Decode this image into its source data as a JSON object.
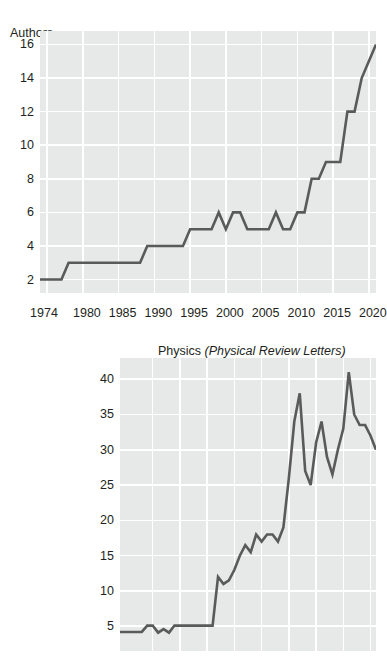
{
  "figure": {
    "axis_title": "Authors"
  },
  "chart_data": [
    {
      "type": "line",
      "id": "biology",
      "title": "Biology (Cell)",
      "title_plain": "Biology",
      "title_italic": "(Cell)",
      "xlabel": "",
      "ylabel": "Authors",
      "xlim": [
        1974,
        2021
      ],
      "ylim": [
        1.2,
        16.8
      ],
      "grid": true,
      "legend": "none",
      "line_color": "#5a5a5a",
      "plot_background": "#e7e8e8",
      "gridline_color": "#ffffff",
      "xticks": [
        1974,
        1980,
        1985,
        1990,
        1995,
        2000,
        2005,
        2010,
        2015,
        2020
      ],
      "xtick_labels": [
        "1974",
        "1980",
        "1985",
        "1990",
        "1995",
        "2000",
        "2005",
        "2010",
        "2015",
        "2020"
      ],
      "yticks": [
        2,
        4,
        6,
        8,
        10,
        12,
        14,
        16
      ],
      "ytick_labels": [
        "2",
        "4",
        "6",
        "8",
        "10",
        "12",
        "14",
        "16"
      ],
      "x": [
        1974,
        1975,
        1976,
        1977,
        1978,
        1979,
        1980,
        1981,
        1982,
        1983,
        1984,
        1985,
        1986,
        1987,
        1988,
        1989,
        1990,
        1991,
        1992,
        1993,
        1994,
        1995,
        1996,
        1997,
        1998,
        1999,
        2000,
        2001,
        2002,
        2003,
        2004,
        2005,
        2006,
        2007,
        2008,
        2009,
        2010,
        2011,
        2012,
        2013,
        2014,
        2015,
        2016,
        2017,
        2018,
        2019,
        2020,
        2021
      ],
      "values": [
        2,
        2,
        2,
        2,
        3,
        3,
        3,
        3,
        3,
        3,
        3,
        3,
        3,
        3,
        3,
        4,
        4,
        4,
        4,
        4,
        4,
        5,
        5,
        5,
        5,
        6,
        5,
        6,
        6,
        5,
        5,
        5,
        5,
        6,
        5,
        5,
        6,
        6,
        8,
        8,
        9,
        9,
        9,
        12,
        12,
        14,
        15,
        16
      ]
    },
    {
      "type": "line",
      "id": "physics",
      "title": "Physics (Physical Review Letters)",
      "title_plain": "Physics",
      "title_italic": "(Physical Review Letters)",
      "xlabel": "",
      "ylabel": "Authors",
      "xlim": [
        1974,
        2021
      ],
      "ylim": [
        1.5,
        43
      ],
      "grid": true,
      "legend": "none",
      "line_color": "#5a5a5a",
      "plot_background": "#e7e8e8",
      "gridline_color": "#ffffff",
      "yticks": [
        5,
        10,
        15,
        20,
        25,
        30,
        35,
        40
      ],
      "ytick_labels": [
        "5",
        "10",
        "15",
        "20",
        "25",
        "30",
        "35",
        "40"
      ],
      "x": [
        1974,
        1975,
        1976,
        1977,
        1978,
        1979,
        1980,
        1981,
        1982,
        1983,
        1984,
        1985,
        1986,
        1987,
        1988,
        1989,
        1990,
        1991,
        1992,
        1993,
        1994,
        1995,
        1996,
        1997,
        1998,
        1999,
        2000,
        2001,
        2002,
        2003,
        2004,
        2005,
        2006,
        2007,
        2008,
        2009,
        2010,
        2011,
        2012,
        2013,
        2014,
        2015,
        2016,
        2017,
        2018,
        2019,
        2020,
        2021
      ],
      "values": [
        4.2,
        4.2,
        4.2,
        4.2,
        4.2,
        5.1,
        5.1,
        4.1,
        4.6,
        4.1,
        5.1,
        5.1,
        5.1,
        5.1,
        5.1,
        5.1,
        5.1,
        5.1,
        12,
        11,
        11.5,
        13,
        15,
        16.5,
        15.5,
        18,
        17,
        18,
        18,
        17,
        19,
        26,
        34,
        38,
        27,
        25,
        31,
        34,
        29,
        26.5,
        30,
        33,
        41,
        35,
        33.5,
        33.5,
        32,
        30
      ]
    }
  ]
}
